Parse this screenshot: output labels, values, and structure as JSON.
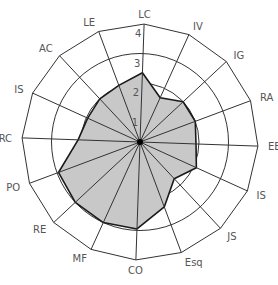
{
  "chart_data": {
    "type": "radar",
    "title": "",
    "categories": [
      "LC",
      "IV",
      "IG",
      "RA",
      "EE",
      "IS",
      "JS",
      "Esq",
      "CO",
      "MF",
      "RE",
      "PO",
      "RC",
      "IS",
      "AC",
      "LE"
    ],
    "series": [
      {
        "name": "Scores",
        "values": [
          2.35,
          1.65,
          2.0,
          2.0,
          1.9,
          2.1,
          1.7,
          2.35,
          2.95,
          3.0,
          3.0,
          2.95,
          2.1,
          1.95,
          2.0,
          2.05
        ]
      }
    ],
    "rlim": [
      0,
      4
    ],
    "ticks": [
      "1",
      "2",
      "3",
      "4"
    ],
    "grid": true,
    "legend": "none"
  },
  "style": {
    "fill_color": "#c8c8c8",
    "line_color": "#1a1a1a",
    "grid_color": "#333333",
    "label_color": "#555555"
  }
}
